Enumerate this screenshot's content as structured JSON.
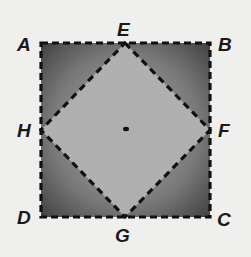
{
  "diagram": {
    "type": "geometry",
    "outer_square": [
      "A",
      "B",
      "C",
      "D"
    ],
    "inner_square": [
      "E",
      "F",
      "G",
      "H"
    ],
    "labels": {
      "A": "A",
      "B": "B",
      "C": "C",
      "D": "D",
      "E": "E",
      "F": "F",
      "G": "G",
      "H": "H"
    },
    "colors": {
      "background": "#efefed",
      "outer_fill_dark": "#4a4a4a",
      "inner_fill_light": "#b8b8b8",
      "dash_line": "#111111"
    }
  }
}
